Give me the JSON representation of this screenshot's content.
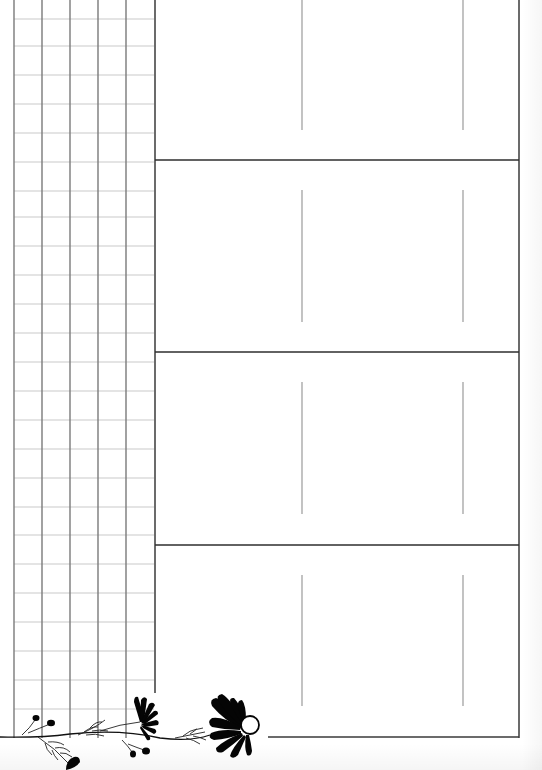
{
  "page": {
    "type": "printable planner sheet",
    "background_color": "#ffffff",
    "line_color": "#3a3a3a",
    "grid_line_color": "#c9c9c9"
  },
  "grid_panel": {
    "columns": 5,
    "rows": 26,
    "column_lines_x": [
      14,
      42,
      70,
      98,
      126,
      154
    ],
    "row_spacing_px": 29
  },
  "main_box": {
    "sections": [
      {
        "label": "",
        "columns": 3
      },
      {
        "label": "",
        "columns": 3
      },
      {
        "label": "",
        "columns": 3
      },
      {
        "label": "",
        "columns": 3
      }
    ],
    "divider_y": [
      160,
      352,
      545
    ]
  },
  "decoration": {
    "icon": "flower-vine-icon",
    "description": "black silhouette flower vine along bottom left"
  }
}
